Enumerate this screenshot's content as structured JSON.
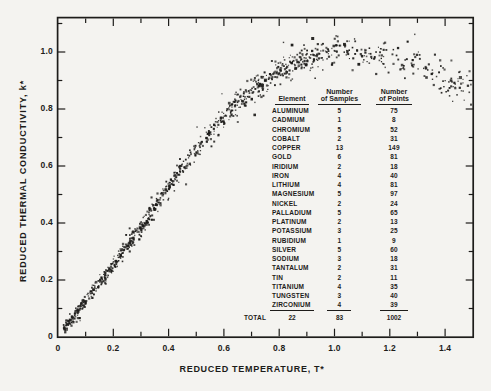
{
  "figure": {
    "paper_color": "#f4f3f0",
    "ink_color": "#1d1c1a"
  },
  "chart_data": {
    "type": "scatter",
    "title": "",
    "xlabel": "REDUCED TEMPERATURE, T*",
    "ylabel": "REDUCED THERMAL CONDUCTIVITY, k*",
    "xlim": [
      0,
      1.503
    ],
    "ylim": [
      0,
      1.123
    ],
    "grid": false,
    "x_major_ticks": [
      0,
      0.2,
      0.4,
      0.6,
      0.8,
      1.0,
      1.2,
      1.4
    ],
    "x_tick_labels": [
      "0",
      "0.2",
      "0.4",
      "0.6",
      "0.8",
      "1.0",
      "1.2",
      "1.4"
    ],
    "y_major_ticks": [
      0,
      0.2,
      0.4,
      0.6,
      0.8,
      1.0
    ],
    "y_tick_labels": [
      "0",
      "0.2",
      "0.4",
      "0.6",
      "0.8",
      "1.0"
    ],
    "minor_tick_step": 0.1,
    "n_points": 1002,
    "trend": [
      [
        0.0,
        0.0
      ],
      [
        0.05,
        0.06
      ],
      [
        0.1,
        0.125
      ],
      [
        0.15,
        0.19
      ],
      [
        0.2,
        0.255
      ],
      [
        0.25,
        0.32
      ],
      [
        0.3,
        0.385
      ],
      [
        0.35,
        0.455
      ],
      [
        0.4,
        0.525
      ],
      [
        0.45,
        0.595
      ],
      [
        0.5,
        0.66
      ],
      [
        0.55,
        0.72
      ],
      [
        0.6,
        0.775
      ],
      [
        0.65,
        0.825
      ],
      [
        0.7,
        0.865
      ],
      [
        0.75,
        0.9
      ],
      [
        0.8,
        0.93
      ],
      [
        0.85,
        0.958
      ],
      [
        0.9,
        0.982
      ],
      [
        0.95,
        0.998
      ],
      [
        1.0,
        1.005
      ],
      [
        1.05,
        1.005
      ],
      [
        1.1,
        1.0
      ],
      [
        1.15,
        0.99
      ],
      [
        1.2,
        0.975
      ],
      [
        1.25,
        0.96
      ],
      [
        1.3,
        0.945
      ],
      [
        1.35,
        0.925
      ],
      [
        1.4,
        0.905
      ],
      [
        1.45,
        0.885
      ],
      [
        1.5,
        0.865
      ]
    ],
    "scatter": {
      "seed": 987654321,
      "y_sd_base": 0.011,
      "y_sd_slope": 0.014,
      "outlier_rate": 0.045,
      "outlier_mult": 2.6
    },
    "x_density_segments": [
      {
        "range": [
          0.02,
          0.15
        ],
        "w": 0.13
      },
      {
        "range": [
          0.15,
          0.3
        ],
        "w": 0.16
      },
      {
        "range": [
          0.3,
          0.45
        ],
        "w": 0.15
      },
      {
        "range": [
          0.45,
          0.6
        ],
        "w": 0.11
      },
      {
        "range": [
          0.6,
          0.75
        ],
        "w": 0.12
      },
      {
        "range": [
          0.75,
          0.9
        ],
        "w": 0.12
      },
      {
        "range": [
          0.9,
          1.05
        ],
        "w": 0.1
      },
      {
        "range": [
          1.05,
          1.2
        ],
        "w": 0.05
      },
      {
        "range": [
          1.2,
          1.35
        ],
        "w": 0.04
      },
      {
        "range": [
          1.35,
          1.5
        ],
        "w": 0.055
      }
    ]
  },
  "table": {
    "columns": [
      {
        "line1": "",
        "line2": "Element"
      },
      {
        "line1": "Number",
        "line2": "of Samples"
      },
      {
        "line1": "Number",
        "line2": "of Points"
      }
    ],
    "rows": [
      [
        "ALUMINUM",
        "5",
        "75"
      ],
      [
        "CADMIUM",
        "1",
        "8"
      ],
      [
        "CHROMIUM",
        "5",
        "52"
      ],
      [
        "COBALT",
        "2",
        "31"
      ],
      [
        "COPPER",
        "13",
        "149"
      ],
      [
        "GOLD",
        "6",
        "81"
      ],
      [
        "IRIDIUM",
        "2",
        "18"
      ],
      [
        "IRON",
        "4",
        "40"
      ],
      [
        "LITHIUM",
        "4",
        "81"
      ],
      [
        "MAGNESIUM",
        "5",
        "97"
      ],
      [
        "NICKEL",
        "2",
        "24"
      ],
      [
        "PALLADIUM",
        "5",
        "65"
      ],
      [
        "PLATINUM",
        "2",
        "13"
      ],
      [
        "POTASSIUM",
        "3",
        "25"
      ],
      [
        "RUBIDIUM",
        "1",
        "9"
      ],
      [
        "SILVER",
        "5",
        "60"
      ],
      [
        "SODIUM",
        "3",
        "18"
      ],
      [
        "TANTALUM",
        "2",
        "31"
      ],
      [
        "TIN",
        "2",
        "11"
      ],
      [
        "TITANIUM",
        "4",
        "35"
      ],
      [
        "TUNGSTEN",
        "3",
        "40"
      ],
      [
        "ZIRCONIUM",
        "4",
        "39"
      ]
    ],
    "total_label": "TOTAL",
    "totals": [
      "22",
      "83",
      "1002"
    ]
  }
}
